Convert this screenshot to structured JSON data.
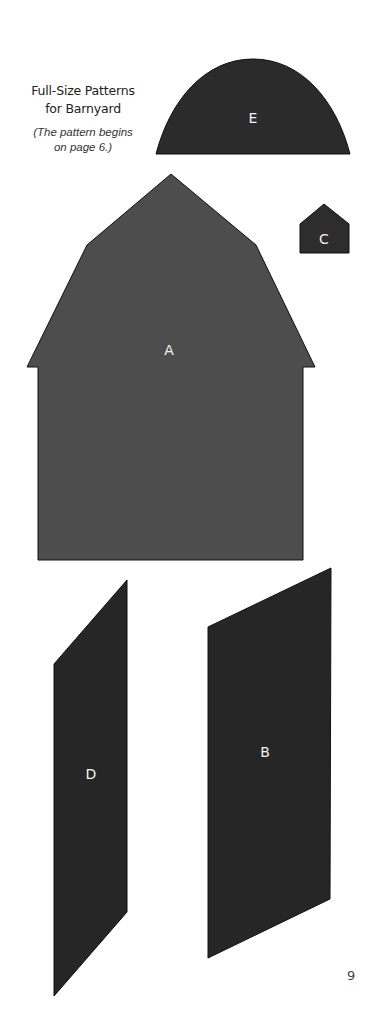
{
  "header": {
    "title_line1": "Full-Size Patterns",
    "title_line2": "for Barnyard",
    "subtitle_line1": "(The pattern begins",
    "subtitle_line2": "on page 6.)"
  },
  "pieces": [
    {
      "id": "E",
      "label": "E",
      "shape": "half-oval",
      "fill": "#2b2b2b",
      "label_pos": [
        253,
        118
      ]
    },
    {
      "id": "C",
      "label": "C",
      "shape": "pentagon",
      "fill": "#2d2d2d",
      "label_pos": [
        324,
        239
      ]
    },
    {
      "id": "A",
      "label": "A",
      "shape": "gambrel-barn",
      "fill": "#4d4d4d",
      "label_pos": [
        169,
        350
      ]
    },
    {
      "id": "D",
      "label": "D",
      "shape": "parallelogram",
      "fill": "#262626",
      "label_pos": [
        91,
        774
      ]
    },
    {
      "id": "B",
      "label": "B",
      "shape": "parallelogram",
      "fill": "#262626",
      "label_pos": [
        265,
        752
      ]
    }
  ],
  "footer": {
    "page_number": "9"
  },
  "colors": {
    "background": "#ffffff",
    "outline": "#111111",
    "label_text": "#f2f2f2"
  }
}
